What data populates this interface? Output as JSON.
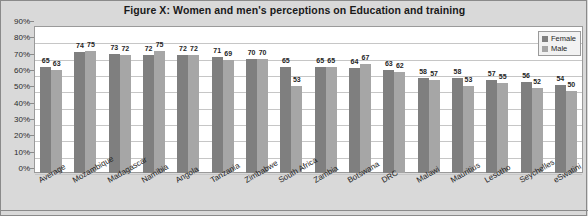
{
  "chart_data": {
    "type": "bar",
    "title": "Figure X: Women and men's perceptions on Education and training",
    "xlabel": "",
    "ylabel": "",
    "ylim": [
      0,
      90
    ],
    "ytick_labels": [
      "90%",
      "80%",
      "70%",
      "60%",
      "50%",
      "40%",
      "30%",
      "20%",
      "10%",
      "0%"
    ],
    "ytick_values": [
      90,
      80,
      70,
      60,
      50,
      40,
      30,
      20,
      10,
      0
    ],
    "grid": true,
    "legend_position": "top-right",
    "categories": [
      "Average",
      "Mozambique",
      "Madagascar",
      "Namibia",
      "Angola",
      "Tanzania",
      "Zimbabwe",
      "South Africa",
      "Zambia",
      "Botswana",
      "DRC",
      "Malawi",
      "Mauritius",
      "Lesotho",
      "Seychelles",
      "eSwatini"
    ],
    "series": [
      {
        "name": "Female",
        "color": "#7f7f7f",
        "values": [
          65,
          74,
          73,
          72,
          72,
          71,
          70,
          65,
          65,
          64,
          63,
          58,
          58,
          57,
          56,
          54
        ]
      },
      {
        "name": "Male",
        "color": "#a6a6a6",
        "values": [
          63,
          75,
          72,
          75,
          72,
          69,
          70,
          53,
          65,
          67,
          62,
          57,
          53,
          55,
          52,
          50
        ]
      }
    ]
  },
  "legend": {
    "items": [
      {
        "label": "Female"
      },
      {
        "label": "Male"
      }
    ]
  },
  "colors": {
    "female": "#7f7f7f",
    "male": "#a6a6a6",
    "background": "#d9d9d9",
    "plot_background": "#ffffff",
    "gridline": "#c6c6c6"
  }
}
